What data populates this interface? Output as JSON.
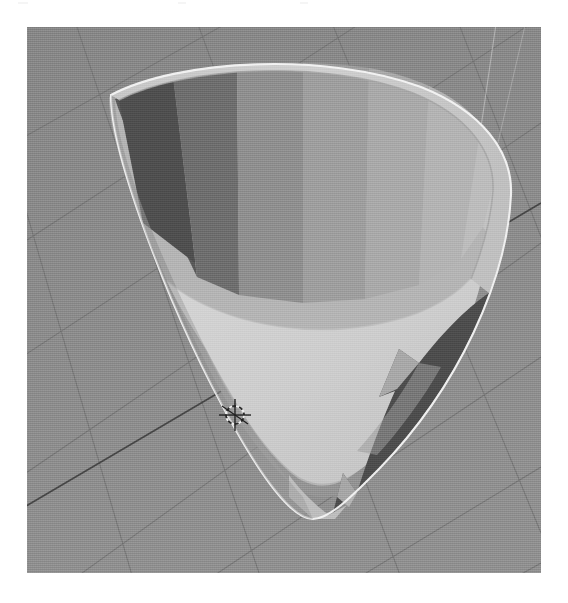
{
  "app": {
    "title": "3D Viewport",
    "mode": "Object Mode",
    "render_shading": "Solid"
  },
  "canvas": {
    "width": 568,
    "height": 603,
    "page_background": "#ffffff"
  },
  "viewport": {
    "x": 27,
    "y": 27,
    "width": 514,
    "height": 546,
    "background_color": "#8b8b8b",
    "grid_line_color": "#6f6f6f",
    "axis_line_color": "#3a3a3a",
    "light_guide_color": "#cfcfcf",
    "grid_visible": true,
    "perspective": true
  },
  "object": {
    "name": "bowl-mesh",
    "kind": "revolved-bowl-cutaway",
    "selected": true,
    "outline_color": "#f6f6f6",
    "rim_color": "#c9c9c9",
    "rim_shadow_color": "#a2a2a2",
    "interior_floor_color": "#cfcfcf",
    "interior_wall_color": "#b0b0b0",
    "exterior_wall_color": "#9a9a9a",
    "dark_facet_color": "#4e4e4e",
    "facet_bands": [
      {
        "name": "band-1",
        "color": "#585858"
      },
      {
        "name": "band-2",
        "color": "#6b6b6b"
      },
      {
        "name": "band-3",
        "color": "#8d8d8d"
      },
      {
        "name": "band-4",
        "color": "#9c9c9c"
      },
      {
        "name": "band-5",
        "color": "#a8a8a8"
      },
      {
        "name": "band-6",
        "color": "#b2b2b2"
      },
      {
        "name": "band-7",
        "color": "#bcbcbc"
      },
      {
        "name": "band-8",
        "color": "#c2c2c2"
      }
    ]
  },
  "cursor_3d": {
    "name": "3d-cursor",
    "x": 235,
    "y": 415,
    "ring_color": "#e8e8e8",
    "crosshair_color": "#2a2a2a"
  },
  "grid": {
    "line_count_u": 7,
    "line_count_v": 7,
    "origin_label": "origin"
  }
}
